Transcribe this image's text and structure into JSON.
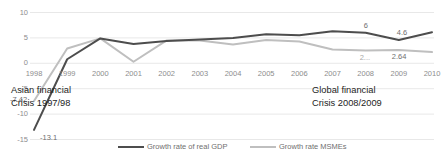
{
  "chart_data": {
    "type": "line",
    "title": "",
    "xlabel": "",
    "ylabel": "",
    "grid": true,
    "legend_position": "bottom",
    "x": [
      1998,
      1999,
      2000,
      2001,
      2002,
      2003,
      2004,
      2005,
      2006,
      2007,
      2008,
      2009,
      2010
    ],
    "xticklabels": [
      "1998",
      "1999",
      "2000",
      "2001",
      "2002",
      "2003",
      "2004",
      "2005",
      "2006",
      "2007",
      "2008",
      "2009",
      "2010"
    ],
    "yticklabels": [
      "10",
      "5",
      "0",
      "-5",
      "-10",
      "-15"
    ],
    "yticks": [
      10,
      5,
      0,
      -5,
      -10,
      -15
    ],
    "ylim": [
      -15,
      10
    ],
    "series": [
      {
        "name": "Growth rate of real GDP",
        "color": "#4d4d4d",
        "values": [
          -13.1,
          0.8,
          4.9,
          3.8,
          4.4,
          4.7,
          5.0,
          5.7,
          5.5,
          6.3,
          6.0,
          4.6,
          6.1
        ]
      },
      {
        "name": "Growth rate MSMEs",
        "color": "#bfbfbf",
        "values": [
          -7.42,
          2.9,
          4.9,
          0.3,
          4.5,
          4.5,
          3.7,
          4.6,
          4.3,
          2.7,
          2.5,
          2.64,
          2.2
        ]
      }
    ],
    "data_labels": [
      {
        "text": "-13.1",
        "x": 1998,
        "y": -13.1,
        "series": "Growth rate of real GDP"
      },
      {
        "text": "-7.42",
        "x": 1998,
        "y": -7.42,
        "series": "Growth rate MSMEs"
      },
      {
        "text": "6",
        "x": 2008,
        "y": 6.0,
        "series": "Growth rate of real GDP"
      },
      {
        "text": "4.6",
        "x": 2009,
        "y": 4.6,
        "series": "Growth rate of real GDP"
      },
      {
        "text": "2...",
        "x": 2008,
        "y": 2.5,
        "series": "Growth rate MSMEs"
      },
      {
        "text": "2.64",
        "x": 2009,
        "y": 2.64,
        "series": "Growth rate MSMEs"
      }
    ],
    "annotations": [
      {
        "line1": "Asian financial",
        "line2": "Crisis 1997/98"
      },
      {
        "line1": "Global financial",
        "line2": "Crisis 2008/2009"
      }
    ]
  },
  "legend": {
    "items": [
      {
        "label": "Growth rate of real GDP",
        "color": "#4d4d4d"
      },
      {
        "label": "Growth rate MSMEs",
        "color": "#bfbfbf"
      }
    ]
  },
  "annotations": {
    "asian": {
      "line1": "Asian financial",
      "line2": "Crisis 1997/98"
    },
    "global": {
      "line1": "Global financial",
      "line2": "Crisis 2008/2009"
    }
  },
  "colors": {
    "gdp_line": "#4d4d4d",
    "msme_line": "#bfbfbf",
    "grid": "#e2e2e2",
    "tick_text": "#8d8d8d",
    "annotation_text": "#1d1d1d"
  }
}
